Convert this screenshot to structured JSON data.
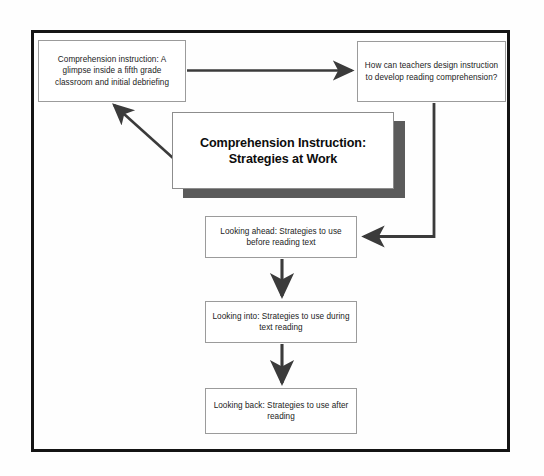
{
  "diagram": {
    "title_card": {
      "line1": "Comprehension Instruction:",
      "line2": "Strategies at Work",
      "shadow_color": "#5b5b5b"
    },
    "nodes": [
      {
        "id": "glimpse",
        "text": "Comprehension instruction: A glimpse inside a fifth grade classroom and initial debriefing"
      },
      {
        "id": "question",
        "text": "How can teachers design instruction to develop reading comprehension?"
      },
      {
        "id": "ahead",
        "text": "Looking ahead: Strategies to use before reading text"
      },
      {
        "id": "into",
        "text": "Looking into: Strategies to use during text reading"
      },
      {
        "id": "back",
        "text": "Looking back: Strategies to use after reading"
      }
    ],
    "connectors": [
      {
        "id": "glimpse-to-question",
        "from": "glimpse",
        "to": "question",
        "style": "straight-horizontal"
      },
      {
        "id": "question-to-ahead",
        "from": "question",
        "to": "ahead",
        "style": "elbow-down-left"
      },
      {
        "id": "titlecard-to-glimpse",
        "from": "title_card",
        "to": "glimpse",
        "style": "diagonal-up-left"
      },
      {
        "id": "ahead-to-into",
        "from": "ahead",
        "to": "into",
        "style": "straight-vertical"
      },
      {
        "id": "into-to-back",
        "from": "into",
        "to": "back",
        "style": "straight-vertical"
      }
    ],
    "colors": {
      "frame": "#141414",
      "node_border": "#9b9b9b",
      "connector": "#3b3b3b",
      "text": "#1b1b1b",
      "background": "#fefefe"
    }
  }
}
